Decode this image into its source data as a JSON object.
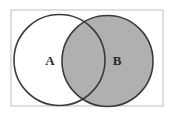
{
  "diagram": {
    "type": "venn",
    "title": "",
    "universe": {
      "name": "universal-set-rectangle",
      "label": "",
      "x": 11,
      "y": 10,
      "width": 152,
      "height": 96,
      "fill": "#ffffff",
      "stroke": "#c8c8c8",
      "stroke_width": 1.2
    },
    "sets": [
      {
        "id": "A",
        "label": "A",
        "name": "circle-a",
        "cx": 59.5,
        "cy": 60,
        "r": 45.5,
        "fill": "#ffffff",
        "stroke": "#3a3a3a",
        "stroke_width": 1.6,
        "shaded": false,
        "label_x": 50,
        "label_y": 62
      },
      {
        "id": "B",
        "label": "B",
        "name": "circle-b",
        "cx": 107.5,
        "cy": 61,
        "r": 45.5,
        "fill": "#b0b0b0",
        "stroke": "#3a3a3a",
        "stroke_width": 1.6,
        "shaded": true,
        "label_x": 117,
        "label_y": 62
      }
    ],
    "intersection": {
      "name": "intersection-region",
      "label": "",
      "fill": "#b0b0b0",
      "shaded": true
    },
    "colors": {
      "shade_gray": "#b0b0b0",
      "outline_dark": "#3a3a3a",
      "frame_gray": "#c8c8c8",
      "background": "#ffffff",
      "label_color": "#2a2a2a"
    }
  }
}
